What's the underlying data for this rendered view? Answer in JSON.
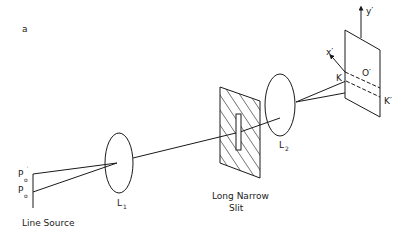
{
  "figure": {
    "panel_label": "a",
    "labels": {
      "line_source": "Line Source",
      "p0": "P",
      "p0_sub": "o",
      "p0_prime": "P",
      "p0_prime_sub": "o",
      "p0_prime_mark": "′",
      "lens1": "L",
      "lens1_sub": "1",
      "slit_line1": "Long Narrow",
      "slit_line2": "Slit",
      "lens2": "L",
      "lens2_sub": "2",
      "screen_x_axis": "x′",
      "screen_y_axis": "y′",
      "origin": "O′",
      "point_k": "K",
      "point_k_prime": "K′"
    },
    "colors": {
      "ink": "#1a1a1a",
      "background": "#ffffff"
    }
  }
}
